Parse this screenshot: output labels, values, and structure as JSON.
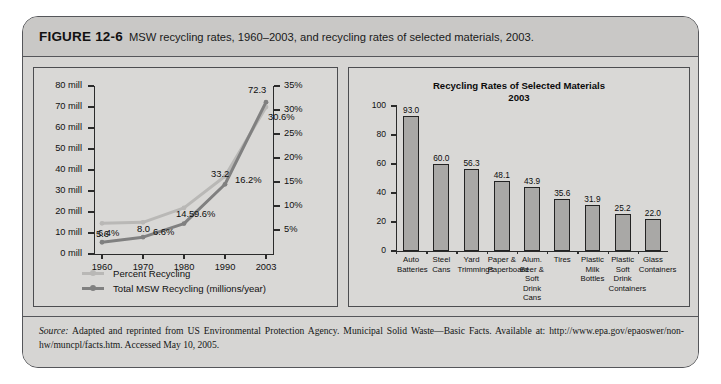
{
  "figure": {
    "number": "FIGURE 12-6",
    "caption": "MSW recycling rates, 1960–2003, and recycling rates of selected materials, 2003."
  },
  "source": {
    "label": "Source:",
    "text": " Adapted and reprinted from US Environmental Protection Agency. Municipal Solid Waste—Basic Facts. Available at: http://www.epa.gov/epaoswer/non-hw/muncpl/facts.htm. Accessed May 10, 2005."
  },
  "colors": {
    "percent_line": "#b9b8b6",
    "total_line": "#808080",
    "bar_fill": "#a9a8a6",
    "axis": "#2b2b2b",
    "panel_bg": "#d9d8d6",
    "frame_bg": "#d6d5d3",
    "header_bg": "#c9c8c6"
  },
  "chart_data": [
    {
      "type": "line",
      "title": "",
      "xlabel": "",
      "ylabel": "",
      "categories": [
        "1960",
        "1970",
        "1980",
        "1990",
        "2003"
      ],
      "y_left_ticks": [
        "0 mill",
        "10 mill",
        "20 mill",
        "30 mill",
        "40 mill",
        "50 mill",
        "60 mill",
        "70 mill",
        "80 mill"
      ],
      "y_left_values": [
        0,
        10,
        20,
        30,
        40,
        50,
        60,
        70,
        80
      ],
      "ylim_left": [
        0,
        80
      ],
      "y_right_ticks": [
        "5%",
        "10%",
        "15%",
        "20%",
        "25%",
        "30%",
        "35%"
      ],
      "y_right_values": [
        5,
        10,
        15,
        20,
        25,
        30,
        35
      ],
      "ylim_right": [
        0,
        35
      ],
      "grid": false,
      "legend_position": "below-left",
      "series": [
        {
          "name": "Percent Recycling",
          "axis": "right",
          "color": "#b9b8b6",
          "values": [
            6.4,
            6.6,
            9.6,
            16.2,
            30.6
          ],
          "labels": [
            "6.4%",
            "6.6%",
            "9.6%",
            "16.2%",
            "30.6%"
          ]
        },
        {
          "name": "Total MSW Recycling (millions/year)",
          "axis": "left",
          "color": "#808080",
          "values": [
            5.6,
            8.0,
            14.5,
            33.2,
            72.3
          ],
          "labels": [
            "5.6",
            "8.0",
            "14.5",
            "33.2",
            "72.3"
          ]
        }
      ]
    },
    {
      "type": "bar",
      "title": "Recycling Rates of Selected Materials",
      "subtitle": "2003",
      "xlabel": "",
      "ylabel": "",
      "ylim": [
        0,
        100
      ],
      "y_ticks": [
        "0",
        "20",
        "40",
        "60",
        "80",
        "100"
      ],
      "y_values": [
        0,
        20,
        40,
        60,
        80,
        100
      ],
      "grid": false,
      "categories": [
        "Auto Batteries",
        "Steel Cans",
        "Yard Trimmings",
        "Paper & Paperboard",
        "Alum. Beer & Soft Drink Cans",
        "Tires",
        "Plastic Milk Bottles",
        "Plastic Soft Drink Containers",
        "Glass Containers"
      ],
      "values": [
        93.0,
        60.0,
        56.3,
        48.1,
        43.9,
        35.6,
        31.9,
        25.2,
        22.0
      ],
      "value_labels": [
        "93.0",
        "60.0",
        "56.3",
        "48.1",
        "43.9",
        "35.6",
        "31.9",
        "25.2",
        "22.0"
      ]
    }
  ]
}
